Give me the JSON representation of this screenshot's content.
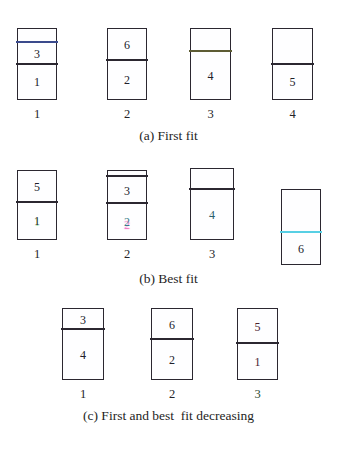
{
  "figure": {
    "kind": "bin-packing-illustration",
    "background": "#ffffff",
    "line_color": "#2b2730",
    "accent_colors": {
      "blue_divider": "#3a4a8c",
      "cyan_divider": "#57cfe4",
      "olive_divider": "#5d5c34",
      "green_tint": "#5adc6e",
      "pink_tint": "#e628a0",
      "cyan_text": "#2b5f6b"
    }
  },
  "rows": [
    {
      "id": "row-a",
      "caption": "(a) First fit",
      "bins": [
        {
          "label": "1",
          "label_tint": "none",
          "segments": [
            {
              "item": "",
              "show_item": false,
              "divider": "blue"
            },
            {
              "item": "3",
              "show_item": true,
              "divider": "plain"
            },
            {
              "item": "1",
              "show_item": true,
              "divider": "none"
            }
          ]
        },
        {
          "label": "2",
          "label_tint": "none",
          "segments": [
            {
              "item": "6",
              "show_item": true,
              "divider": "plain"
            },
            {
              "item": "2",
              "show_item": true,
              "divider": "none"
            }
          ]
        },
        {
          "label": "3",
          "label_tint": "none",
          "segments": [
            {
              "item": "",
              "show_item": false,
              "divider": "olive"
            },
            {
              "item": "4",
              "show_item": true,
              "divider": "none"
            }
          ]
        },
        {
          "label": "4",
          "label_tint": "none",
          "segments": [
            {
              "item": "",
              "show_item": false,
              "divider": "plain"
            },
            {
              "item": "5",
              "show_item": true,
              "divider": "none"
            }
          ]
        }
      ]
    },
    {
      "id": "row-b",
      "caption": "(b) Best fit",
      "bins": [
        {
          "label": "1",
          "label_tint": "none",
          "segments": [
            {
              "item": "5",
              "show_item": true,
              "divider": "plain"
            },
            {
              "item": "1",
              "show_item": true,
              "item_tint": "green",
              "divider": "none"
            }
          ]
        },
        {
          "label": "2",
          "label_tint": "none",
          "segments": [
            {
              "item": "",
              "show_item": false,
              "divider": "plain"
            },
            {
              "item": "3",
              "show_item": true,
              "divider": "plain"
            },
            {
              "item": "2",
              "show_item": true,
              "item_tint": "pink",
              "divider": "none"
            }
          ]
        },
        {
          "label": "3",
          "label_tint": "none",
          "segments": [
            {
              "item": "",
              "show_item": false,
              "divider": "plain"
            },
            {
              "item": "4",
              "show_item": true,
              "item_tint": "cyan",
              "divider": "none"
            }
          ]
        },
        {
          "label": "",
          "label_tint": "none",
          "segments": [
            {
              "item": "",
              "show_item": false,
              "divider": "cyan"
            },
            {
              "item": "6",
              "show_item": true,
              "divider": "none"
            }
          ]
        }
      ]
    },
    {
      "id": "row-c",
      "caption": "(c) First and best  fit decreasing",
      "bins": [
        {
          "label": "1",
          "label_tint": "none",
          "segments": [
            {
              "item": "3",
              "show_item": true,
              "divider": "plain"
            },
            {
              "item": "4",
              "show_item": true,
              "divider": "none"
            }
          ]
        },
        {
          "label": "2",
          "label_tint": "none",
          "segments": [
            {
              "item": "6",
              "show_item": true,
              "divider": "plain"
            },
            {
              "item": "2",
              "show_item": true,
              "divider": "none"
            }
          ]
        },
        {
          "label": "3",
          "label_tint": "green",
          "segments": [
            {
              "item": "5",
              "show_item": true,
              "item_tint": "red",
              "divider": "plain"
            },
            {
              "item": "1",
              "show_item": true,
              "item_tint": "red",
              "divider": "none"
            }
          ]
        }
      ]
    }
  ]
}
